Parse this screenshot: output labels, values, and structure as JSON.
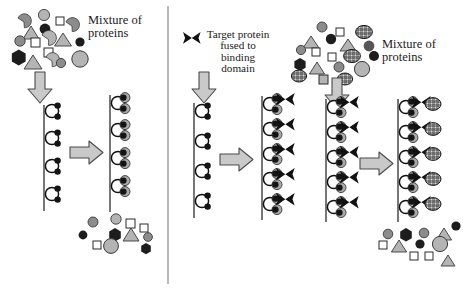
{
  "figure": {
    "width": 463,
    "height": 290,
    "background": "#ffffff"
  },
  "labels": {
    "left_mixture": "Mixture of\nproteins",
    "target_protein": "Target protein\nfused to\nbinding\ndomain",
    "right_mixture": "Mixture of\nproteins"
  },
  "colors": {
    "outline": "#111111",
    "arrow_fill": "#c9c9c9",
    "arrow_stroke": "#4a4a4a",
    "divider": "#9a9a9a",
    "column_line": "#555555",
    "bead_white": "#ffffff",
    "dot_black": "#141414",
    "disc_gray": "#a8a8a8",
    "bowtie_black": "#111111",
    "protein_gray_light": "#b4b4b4",
    "protein_gray_mid": "#8c8c8c",
    "protein_gray_dark": "#555555",
    "protein_black": "#1d1d1d",
    "mesh_fill": "#d8d8d8"
  },
  "panels": [
    {
      "id": "panel-left",
      "name": "untagged-protein-mixture-flowthrough",
      "mixture_top": {
        "label": "Mixture of proteins",
        "has_target_protein": false,
        "shape_counts": {
          "circle": 8,
          "square": 4,
          "triangle": 3,
          "hexagon": 2,
          "crescent": 3,
          "mesh_ellipse": 0
        }
      },
      "column_before": {
        "ligand_units": 4,
        "bound_target": 0
      },
      "column_after": {
        "ligand_units": 4,
        "bound_target": 0,
        "bound_gray_discs": 8
      },
      "mixture_bottom": {
        "has_target_protein": false,
        "shape_counts": {
          "circle": 5,
          "square": 2,
          "triangle": 1,
          "hexagon": 2,
          "crescent": 0,
          "mesh_ellipse": 0
        }
      },
      "arrows": [
        "down",
        "right"
      ]
    },
    {
      "id": "panel-middle",
      "name": "tagged-target-protein-binding",
      "legend": {
        "label": "Target protein fused to binding domain",
        "icon": "bowtie-icon"
      },
      "column_before": {
        "ligand_units": 4,
        "bound_target": 0
      },
      "column_after": {
        "ligand_units": 5,
        "bound_target": 5,
        "bound_gray_discs": 10
      },
      "arrows": [
        "down",
        "right"
      ]
    },
    {
      "id": "panel-right",
      "name": "target-protein-capture-from-mixture",
      "mixture_top": {
        "label": "Mixture of proteins",
        "has_target_protein": true,
        "shape_counts": {
          "circle": 9,
          "square": 4,
          "triangle": 3,
          "hexagon": 2,
          "crescent": 0,
          "mesh_ellipse": 6
        }
      },
      "column_before": {
        "ligand_units": 5,
        "bound_target": 5
      },
      "column_after": {
        "ligand_units": 5,
        "bound_target": 5,
        "captured_mesh_proteins": 5
      },
      "mixture_bottom": {
        "has_target_protein": false,
        "shape_counts": {
          "circle": 6,
          "square": 3,
          "triangle": 3,
          "hexagon": 1,
          "crescent": 0,
          "mesh_ellipse": 0
        }
      },
      "arrows": [
        "down",
        "right"
      ]
    }
  ],
  "legend_items": [
    {
      "name": "ligand-bead",
      "description": "White circle with two black dots on a column matrix line"
    },
    {
      "name": "bowtie-icon",
      "description": "Black bowtie = binding domain fused to target protein"
    },
    {
      "name": "mesh-ellipse",
      "description": "Cross-hatched ellipse = target protein"
    },
    {
      "name": "gray-disc",
      "description": "Gray disc = captured binding partner"
    }
  ]
}
